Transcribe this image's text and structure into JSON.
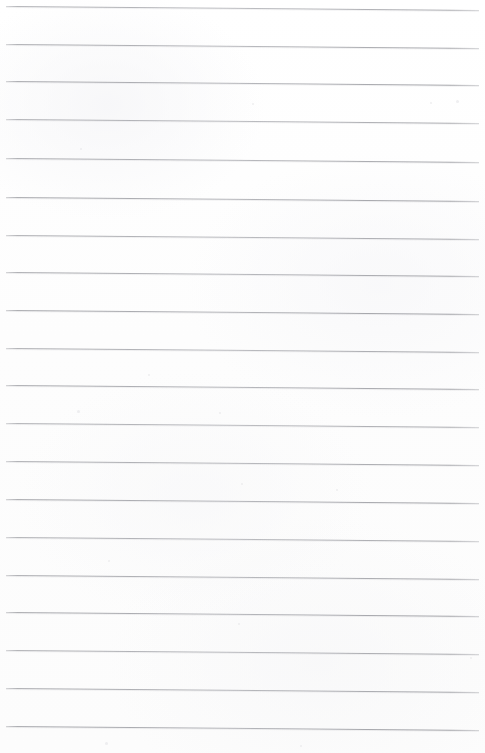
{
  "document": {
    "kind": "scanned-lined-paper",
    "title": "Blank ruled notebook page",
    "page_width": 485,
    "page_height": 753,
    "background_color": "#fdfdfd",
    "page_border_color": "#ffffff",
    "content_text": "",
    "has_handwriting": false,
    "has_printed_text": false,
    "has_margin_rule": false,
    "has_holes": false
  },
  "ruling": {
    "line_color": "#a9aaae",
    "line_thickness_px": 1,
    "line_count": 20,
    "line_start_x": 6,
    "line_end_x": 479,
    "line_length_px": 473,
    "first_line_y": 6,
    "last_line_y": 726,
    "spacing_px": 37.9,
    "skew_degrees": 0.48,
    "skew_drop_px": 4,
    "line_y_positions": [
      6,
      44,
      81,
      119,
      158,
      197,
      235,
      272,
      310,
      348,
      385,
      423,
      461,
      499,
      537,
      575,
      612,
      650,
      688,
      726
    ]
  },
  "specks": [
    {
      "x": 252,
      "y": 103,
      "size": 2
    },
    {
      "x": 456,
      "y": 100,
      "size": 3
    },
    {
      "x": 80,
      "y": 148,
      "size": 2
    },
    {
      "x": 430,
      "y": 102,
      "size": 2
    },
    {
      "x": 148,
      "y": 374,
      "size": 2
    },
    {
      "x": 77,
      "y": 410,
      "size": 3
    },
    {
      "x": 219,
      "y": 412,
      "size": 2
    },
    {
      "x": 241,
      "y": 483,
      "size": 2
    },
    {
      "x": 336,
      "y": 489,
      "size": 2
    },
    {
      "x": 108,
      "y": 560,
      "size": 2
    },
    {
      "x": 238,
      "y": 623,
      "size": 2
    },
    {
      "x": 470,
      "y": 657,
      "size": 2
    },
    {
      "x": 105,
      "y": 742,
      "size": 3
    },
    {
      "x": 300,
      "y": 745,
      "size": 2
    }
  ]
}
